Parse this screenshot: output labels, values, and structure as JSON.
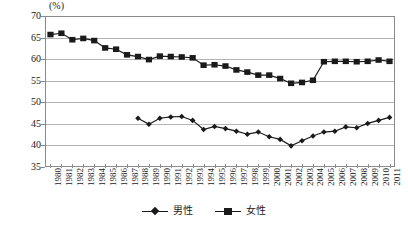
{
  "chart_data": {
    "type": "line",
    "title": "",
    "xlabel": "",
    "ylabel": "",
    "unit_label": "(%)",
    "ylim": [
      35,
      70
    ],
    "ytick_step": 5,
    "yticks": [
      70,
      65,
      60,
      55,
      50,
      45,
      40,
      35
    ],
    "grid": true,
    "legend_position": "bottom-center",
    "categories": [
      "1980",
      "1981",
      "1982",
      "1983",
      "1984",
      "1985",
      "1986",
      "1987",
      "1988",
      "1989",
      "1990",
      "1991",
      "1992",
      "1993",
      "1994",
      "1995",
      "1996",
      "1997",
      "1998",
      "1999",
      "2000",
      "2001",
      "2002",
      "2003",
      "2004",
      "2005",
      "2006",
      "2007",
      "2008",
      "2009",
      "2010",
      "2011"
    ],
    "series": [
      {
        "name": "男性",
        "marker": "diamond",
        "color": "#1a1a1a",
        "values": [
          null,
          null,
          null,
          null,
          null,
          null,
          null,
          null,
          46.3,
          44.9,
          46.3,
          46.6,
          46.7,
          45.8,
          43.7,
          44.4,
          43.9,
          43.3,
          42.6,
          43.1,
          42.0,
          41.4,
          39.9,
          41.1,
          42.2,
          43.1,
          43.3,
          44.3,
          44.1,
          45.1,
          45.8,
          46.5
        ]
      },
      {
        "name": "女性",
        "marker": "square",
        "color": "#1a1a1a",
        "values": [
          65.7,
          66.0,
          64.5,
          64.8,
          64.3,
          62.6,
          62.3,
          61.0,
          60.6,
          59.9,
          60.7,
          60.6,
          60.5,
          60.3,
          58.6,
          58.7,
          58.4,
          57.5,
          57.0,
          56.3,
          56.3,
          55.5,
          54.4,
          54.6,
          55.1,
          59.4,
          59.5,
          59.5,
          59.4,
          59.5,
          59.8,
          59.5
        ]
      }
    ]
  },
  "legend": {
    "entries": [
      {
        "label": "男性"
      },
      {
        "label": "女性"
      }
    ]
  }
}
